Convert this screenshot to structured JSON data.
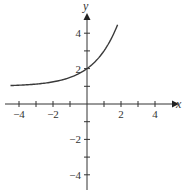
{
  "chart_data": {
    "type": "line",
    "title": "",
    "xlabel": "x",
    "ylabel": "y",
    "xlim": [
      -4.6,
      5
    ],
    "ylim": [
      -5,
      5
    ],
    "x_ticks": [
      -4,
      -3,
      -2,
      -1,
      1,
      2,
      3,
      4
    ],
    "x_tick_labels": [
      "−4",
      "−2",
      "2",
      "4"
    ],
    "x_tick_label_values": [
      -4,
      -2,
      2,
      4
    ],
    "y_ticks": [
      -4,
      -3,
      -2,
      -1,
      1,
      2,
      3,
      4
    ],
    "y_tick_labels": [
      "4",
      "2",
      "−2",
      "−4"
    ],
    "y_tick_label_values": [
      4,
      2,
      -2,
      -4
    ],
    "grid": false,
    "legend": null,
    "series": [
      {
        "name": "y = 2^x + 1",
        "x": [
          -4.5,
          -4,
          -3,
          -2,
          -1,
          0,
          0.5,
          1,
          1.5,
          1.8
        ],
        "values": [
          1.04,
          1.06,
          1.13,
          1.25,
          1.5,
          2,
          2.41,
          3,
          3.83,
          4.48
        ]
      }
    ],
    "colors": {
      "axis": "#333333",
      "curve": "#3a3a3a"
    }
  }
}
